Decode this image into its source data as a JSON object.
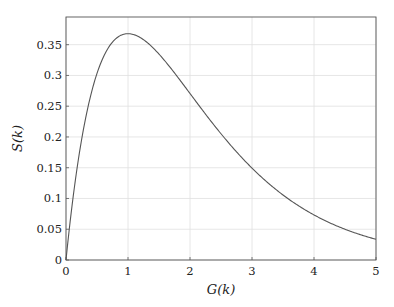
{
  "chart_data": {
    "type": "line",
    "title": "",
    "xlabel": "G(k)",
    "ylabel": "S(k)",
    "xlim": [
      0,
      5
    ],
    "ylim": [
      0,
      0.395
    ],
    "grid": true,
    "legend": null,
    "x_ticks": [
      0,
      1,
      2,
      3,
      4,
      5
    ],
    "x_tick_labels": [
      "0",
      "1",
      "2",
      "3",
      "4",
      "5"
    ],
    "y_ticks": [
      0,
      0.05,
      0.1,
      0.15,
      0.2,
      0.25,
      0.3,
      0.35
    ],
    "y_tick_labels": [
      "0",
      "0.05",
      "0.1",
      "0.15",
      "0.2",
      "0.25",
      "0.3",
      "0.35"
    ],
    "series": [
      {
        "name": "S(k) = G(k)·e^(−G(k))",
        "color": "#555555",
        "x": [
          0,
          0.1,
          0.25,
          0.5,
          0.75,
          1.0,
          1.25,
          1.5,
          1.75,
          2.0,
          2.5,
          3.0,
          3.5,
          4.0,
          4.5,
          5.0
        ],
        "y": [
          0,
          0.09,
          0.195,
          0.303,
          0.354,
          0.368,
          0.358,
          0.335,
          0.304,
          0.271,
          0.205,
          0.149,
          0.106,
          0.073,
          0.05,
          0.034
        ]
      }
    ]
  },
  "colors": {
    "axis": "#555555",
    "grid": "#e0e0e0",
    "curve": "#555555"
  }
}
